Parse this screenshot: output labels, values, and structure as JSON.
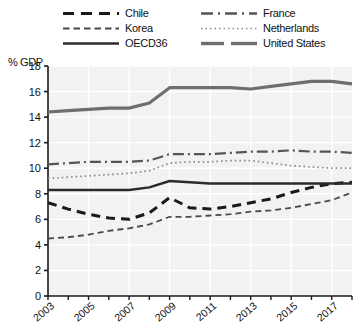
{
  "chart_data": {
    "type": "line",
    "title": "",
    "xlabel": "",
    "ylabel": "% GDP",
    "ylim": [
      0,
      18
    ],
    "yticks": [
      0,
      2,
      4,
      6,
      8,
      10,
      12,
      14,
      16,
      18
    ],
    "xlim": [
      2003,
      2018
    ],
    "xticks_labeled": [
      2003,
      2005,
      2007,
      2009,
      2011,
      2013,
      2015,
      2017
    ],
    "x": [
      2003,
      2004,
      2005,
      2006,
      2007,
      2008,
      2009,
      2010,
      2011,
      2012,
      2013,
      2014,
      2015,
      2016,
      2017,
      2018
    ],
    "grid": true,
    "legend_position": "top",
    "series": [
      {
        "name": "Chile",
        "style": "dashed-thick",
        "color": "#1a1a1a",
        "values": [
          7.3,
          6.8,
          6.4,
          6.1,
          6.0,
          6.5,
          7.7,
          6.9,
          6.8,
          7.0,
          7.3,
          7.6,
          8.1,
          8.5,
          8.8,
          8.9
        ]
      },
      {
        "name": "Korea",
        "style": "dashed-thin",
        "color": "#4a4a4a",
        "values": [
          4.5,
          4.6,
          4.8,
          5.1,
          5.3,
          5.6,
          6.2,
          6.2,
          6.3,
          6.4,
          6.6,
          6.7,
          6.9,
          7.2,
          7.5,
          8.1
        ]
      },
      {
        "name": "OECD36",
        "style": "solid-dark",
        "color": "#2b2b2b",
        "values": [
          8.3,
          8.3,
          8.3,
          8.3,
          8.3,
          8.5,
          9.0,
          8.9,
          8.8,
          8.8,
          8.8,
          8.8,
          8.8,
          8.8,
          8.8,
          8.8
        ]
      },
      {
        "name": "France",
        "style": "dashdot",
        "color": "#555555",
        "values": [
          10.3,
          10.4,
          10.5,
          10.5,
          10.5,
          10.6,
          11.1,
          11.1,
          11.1,
          11.2,
          11.3,
          11.3,
          11.4,
          11.3,
          11.3,
          11.2
        ]
      },
      {
        "name": "Netherlands",
        "style": "dotted",
        "color": "#8a8a8a",
        "values": [
          9.2,
          9.3,
          9.4,
          9.5,
          9.6,
          9.8,
          10.4,
          10.5,
          10.5,
          10.6,
          10.6,
          10.4,
          10.2,
          10.1,
          10.0,
          10.0
        ]
      },
      {
        "name": "United States",
        "style": "solid-thick-gray",
        "color": "#6e6e6e",
        "values": [
          14.4,
          14.5,
          14.6,
          14.7,
          14.7,
          15.1,
          16.3,
          16.3,
          16.3,
          16.3,
          16.2,
          16.4,
          16.6,
          16.8,
          16.8,
          16.6
        ]
      }
    ]
  },
  "legend": {
    "items": [
      {
        "label": "Chile",
        "swatch": "dashed-thick-swatch"
      },
      {
        "label": "France",
        "swatch": "dashdot-swatch"
      },
      {
        "label": "Korea",
        "swatch": "dashed-thin-swatch"
      },
      {
        "label": "Netherlands",
        "swatch": "dotted-swatch"
      },
      {
        "label": "OECD36",
        "swatch": "solid-dark-swatch"
      },
      {
        "label": "United States",
        "swatch": "solid-thick-gray-swatch"
      }
    ]
  },
  "axis": {
    "y_title": "% GDP"
  },
  "colors": {
    "plot_background": "#f2f2f2",
    "grid": "#ffffff",
    "axis": "#1a1a1a",
    "text": "#111111"
  }
}
